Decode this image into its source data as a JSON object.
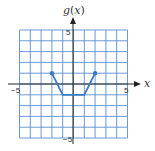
{
  "chart_data": {
    "type": "line",
    "title": "",
    "xlabel": "x",
    "ylabel": "g(x)",
    "xlim": [
      -5,
      5
    ],
    "ylim": [
      -5,
      5
    ],
    "grid": true,
    "x_tick_labels": [
      "-5",
      "5"
    ],
    "y_tick_labels": [
      "5",
      "-5"
    ],
    "series": [
      {
        "name": "g(x)",
        "points": [
          [
            -2,
            1
          ],
          [
            -1,
            -1
          ],
          [
            1,
            -1
          ],
          [
            2,
            1
          ]
        ],
        "endpoints_closed": [
          [
            -2,
            1
          ],
          [
            2,
            1
          ]
        ]
      }
    ],
    "legend": null
  },
  "labels": {
    "y_axis_name": "g",
    "y_axis_paren_open": "(",
    "y_axis_var": "x",
    "y_axis_paren_close": ")",
    "x_axis_name": "x",
    "x_min_tick": "−5",
    "x_max_tick": "5",
    "y_max_tick": "5",
    "y_min_tick": "−5"
  },
  "colors": {
    "grid": "#5b8fd1",
    "axis": "#1a1a1a",
    "curve": "#3a79c4",
    "points": "#3a79c4"
  }
}
